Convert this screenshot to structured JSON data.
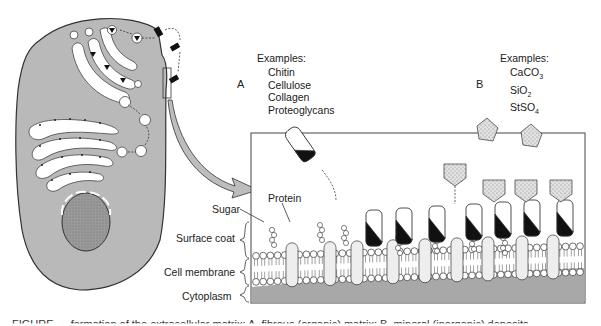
{
  "figure": {
    "panel_a": {
      "letter": "A",
      "examples_heading": "Examples:",
      "examples": [
        "Chitin",
        "Cellulose",
        "Collagen",
        "Proteoglycans"
      ]
    },
    "panel_b": {
      "letter": "B",
      "examples_heading": "Examples:",
      "examples": [
        {
          "base": "CaCO",
          "sub": "3"
        },
        {
          "base": "SiO",
          "sub": "2"
        },
        {
          "base": "StSO",
          "sub": "4"
        }
      ]
    },
    "labels": {
      "sugar": "Sugar",
      "protein": "Protein",
      "surface_coat": "Surface coat",
      "cell_membrane": "Cell membrane",
      "cytoplasm": "Cytoplasm"
    },
    "colors": {
      "cell_gray": "#b8b8b8",
      "cytoplasm_gray": "#a9a9a9",
      "outline": "#333333",
      "protein_dark": "#111111",
      "mineral_stipple": "#d9d9d9"
    },
    "caption": "FIGURE — formation of the extracellular matrix: A, fibrous (organic) matrix; B, mineral (inorganic) deposits"
  }
}
